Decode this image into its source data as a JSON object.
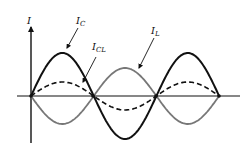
{
  "diagram": {
    "axis": {
      "y_label": "I",
      "origin": [
        31,
        96
      ],
      "y_axis": {
        "x": 31,
        "top": 27,
        "bottom": 143
      },
      "x_axis": {
        "y": 96,
        "left": 17,
        "right": 240
      }
    },
    "waves": [
      {
        "id": "ic",
        "name": "I_C",
        "label_main": "I",
        "label_sub": "C",
        "amplitude": 43,
        "phase": 1,
        "color": "#111111",
        "style": "solid",
        "width": 2.0
      },
      {
        "id": "il",
        "name": "I_L",
        "label_main": "I",
        "label_sub": "L",
        "amplitude": 28,
        "phase": -1,
        "color": "#777777",
        "style": "solid",
        "width": 1.8
      },
      {
        "id": "icl",
        "name": "I_CL",
        "label_main": "I",
        "label_sub": "CL",
        "amplitude": 14,
        "phase": 1,
        "color": "#111111",
        "style": "dashed",
        "width": 1.6
      }
    ],
    "wave_x_start": 31,
    "wave_x_end": 219,
    "half_period": 62.7,
    "zero_crossings_x": [
      31,
      93,
      156,
      219
    ],
    "labels": {
      "I": {
        "text": "I",
        "x": 27,
        "y": 24
      },
      "IC": {
        "main": "I",
        "sub": "C",
        "x": 76,
        "y": 24,
        "arrow_from": [
          78,
          28
        ],
        "arrow_to": [
          67,
          48
        ]
      },
      "ICL": {
        "main": "I",
        "sub": "CL",
        "x": 92,
        "y": 50,
        "arrow_from": [
          96,
          57
        ],
        "arrow_to": [
          83,
          82
        ]
      },
      "IL": {
        "main": "I",
        "sub": "L",
        "x": 151,
        "y": 34,
        "arrow_from": [
          154,
          38
        ],
        "arrow_to": [
          139,
          68
        ]
      }
    }
  }
}
